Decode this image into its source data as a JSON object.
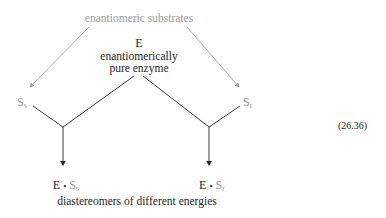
{
  "diagram": {
    "top_label": "enantiomeric substrates",
    "enzyme": {
      "symbol": "E",
      "line1": "enantiomerically",
      "line2": "pure enzyme"
    },
    "substrate_left": {
      "base": "S",
      "subscript": "s"
    },
    "substrate_right": {
      "base": "S",
      "subscript": "r"
    },
    "complex_left": {
      "enzyme": "E",
      "dot": "•",
      "base": "S",
      "subscript": "s"
    },
    "complex_right": {
      "enzyme": "E",
      "dot": "•",
      "base": "S",
      "subscript": "r"
    },
    "bottom_label": "diastereomers of different energies",
    "equation_number": "(26.36)"
  },
  "colors": {
    "gray": "#9a9a9a",
    "black": "#262626"
  }
}
